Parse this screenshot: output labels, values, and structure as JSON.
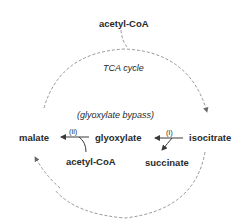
{
  "diagram": {
    "title": "TCA cycle",
    "subtitle": "(glyoxylate bypass)",
    "nodes": {
      "acetyl_coa_top": "acetyl-CoA",
      "isocitrate": "isocitrate",
      "glyoxylate": "glyoxylate",
      "succinate": "succinate",
      "malate": "malate",
      "acetyl_coa_bottom": "acetyl-CoA"
    },
    "enzymes": {
      "i": "(i)",
      "ii": "(ii)"
    },
    "colors": {
      "text": "#2a2a2a",
      "dashed_line": "#8a8a8a",
      "arrow": "#3a3a3a"
    }
  }
}
